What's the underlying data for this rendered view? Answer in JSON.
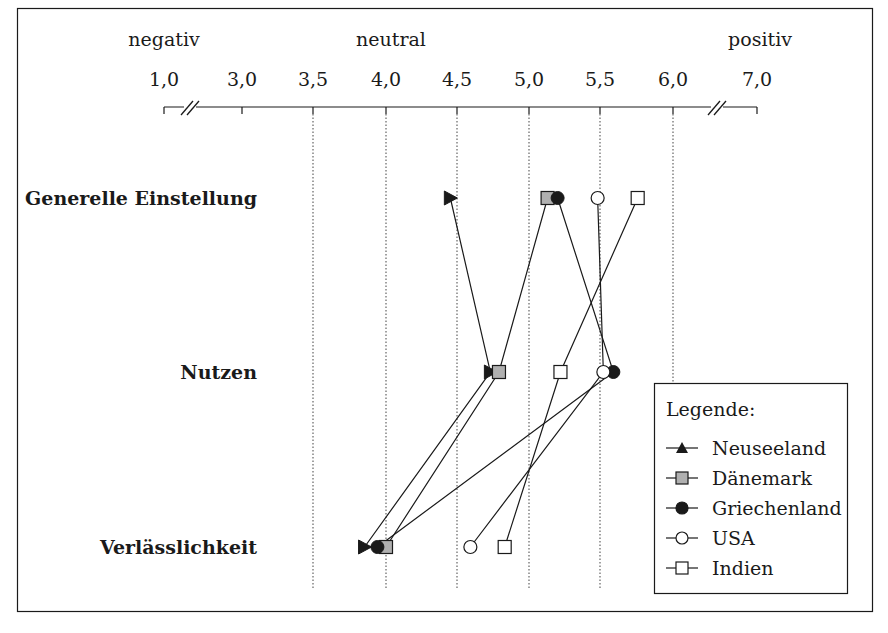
{
  "chart_data": {
    "type": "line",
    "orientation": "horizontal-profile",
    "title": "",
    "scale_labels": {
      "left": "negativ",
      "center": "neutral",
      "right": "positiv"
    },
    "x_ticks": [
      "1,0",
      "3,0",
      "3,5",
      "4,0",
      "4,5",
      "5,0",
      "5,5",
      "6,0",
      "7,0"
    ],
    "x_tick_values": [
      1.0,
      3.0,
      3.5,
      4.0,
      4.5,
      5.0,
      5.5,
      6.0,
      7.0
    ],
    "axis_breaks": [
      "between 1,0 and 3,0",
      "between 6,0 and 7,0"
    ],
    "grid": {
      "dotted_vertical_at": [
        3.5,
        4.0,
        4.5,
        5.0,
        5.5,
        6.0
      ]
    },
    "categories": [
      "Generelle Einstellung",
      "Nutzen",
      "Verlässlichkeit"
    ],
    "series": [
      {
        "name": "Neuseeland",
        "marker": "filled-triangle",
        "values": [
          4.45,
          4.73,
          3.85
        ]
      },
      {
        "name": "Dänemark",
        "marker": "gray-square",
        "values": [
          5.13,
          4.79,
          4.0
        ]
      },
      {
        "name": "Griechenland",
        "marker": "filled-circle",
        "values": [
          5.2,
          5.59,
          3.94
        ]
      },
      {
        "name": "USA",
        "marker": "open-circle",
        "values": [
          5.48,
          5.52,
          4.59
        ]
      },
      {
        "name": "Indien",
        "marker": "open-square",
        "values": [
          5.76,
          5.22,
          4.83
        ]
      }
    ],
    "legend": {
      "title": "Legende:",
      "position": "bottom-right"
    },
    "colors": {
      "line": "#1a1a1a",
      "gray_fill": "#b0b0b0",
      "grid": "#555555"
    }
  }
}
